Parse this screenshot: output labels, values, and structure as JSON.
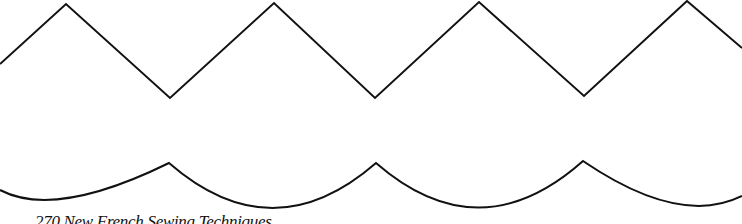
{
  "page": {
    "footer_text": "270 New French Sewing Techniques"
  },
  "pattern": {
    "stroke_color": "#111111",
    "zigzag_points": [
      [
        0,
        64
      ],
      [
        66,
        4
      ],
      [
        170,
        98
      ],
      [
        274,
        3
      ],
      [
        375,
        98
      ],
      [
        479,
        2
      ],
      [
        584,
        96
      ],
      [
        687,
        1
      ],
      [
        742,
        48
      ]
    ],
    "scallop_cusps": [
      [
        169,
        163
      ],
      [
        376,
        163
      ],
      [
        583,
        161
      ]
    ],
    "scallop_bottom_y": 209
  }
}
